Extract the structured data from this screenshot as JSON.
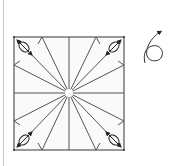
{
  "diagram": {
    "type": "origami-fold-diagram",
    "colors": {
      "line": "#555555",
      "arrow": "#222222",
      "background": "#ffffff",
      "page_edge": "#c8c8c8"
    },
    "square": {
      "x": 14,
      "y": 37,
      "size": 110
    },
    "center_hole_radius": 4,
    "radial_creases": 16,
    "corner_symbols": [
      "top-left",
      "top-right",
      "bottom-left",
      "bottom-right"
    ],
    "side_symbol": "rotate-arrow"
  }
}
